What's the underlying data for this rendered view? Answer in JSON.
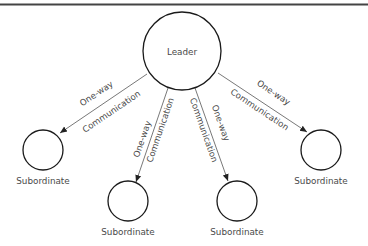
{
  "diagram": {
    "type": "hub-and-spoke communication diagram",
    "colors": {
      "rule": "#444444",
      "node_stroke": "#1a1a1a",
      "edge": "#555555",
      "text": "#4a4a4a"
    },
    "leader": {
      "label": "Leader"
    },
    "subordinates": [
      {
        "label": "Subordinate"
      },
      {
        "label": "Subordinate"
      },
      {
        "label": "Subordinate"
      },
      {
        "label": "Subordinate"
      }
    ],
    "edges": [
      {
        "top_label": "One-way",
        "bottom_label": "Communication",
        "from": "Leader",
        "to": "Subordinate 1"
      },
      {
        "top_label": "One-way",
        "bottom_label": "Communication",
        "from": "Leader",
        "to": "Subordinate 2"
      },
      {
        "top_label": "Communication",
        "bottom_label": "One-way",
        "from": "Leader",
        "to": "Subordinate 3"
      },
      {
        "top_label": "One-way",
        "bottom_label": "Communication",
        "from": "Leader",
        "to": "Subordinate 4"
      }
    ]
  }
}
